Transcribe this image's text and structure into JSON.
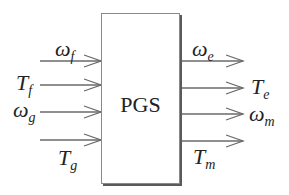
{
  "block": {
    "label": "PGS"
  },
  "inputs": [
    {
      "symbol": "ω",
      "subscript": "f"
    },
    {
      "symbol": "T",
      "subscript": "f"
    },
    {
      "symbol": "ω",
      "subscript": "g"
    },
    {
      "symbol": "T",
      "subscript": "g"
    }
  ],
  "outputs": [
    {
      "symbol": "ω",
      "subscript": "e"
    },
    {
      "symbol": "T",
      "subscript": "e"
    },
    {
      "symbol": "ω",
      "subscript": "m"
    },
    {
      "symbol": "T",
      "subscript": "m"
    }
  ],
  "colors": {
    "line": "#6a6a6a",
    "border": "#8a8a8a",
    "shadow": "#5a5a5a",
    "text": "#222222"
  }
}
